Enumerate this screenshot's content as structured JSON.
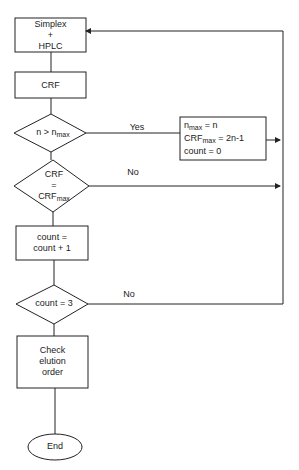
{
  "flowchart": {
    "nodes": {
      "start": {
        "type": "process",
        "line1": "Simplex",
        "line2": "+",
        "line3": "HPLC"
      },
      "crf": {
        "type": "process",
        "label": "CRF"
      },
      "decision1": {
        "type": "decision",
        "lhs": "n > n",
        "sub": "max"
      },
      "update": {
        "type": "process",
        "l1a": "n",
        "l1sub": "max",
        "l1b": " = n",
        "l2a": "CRF",
        "l2sub": "max",
        "l2b": " = 2n-1",
        "l3": "count = 0"
      },
      "decision2": {
        "type": "decision",
        "line1": "CRF",
        "line2": "=",
        "line3a": "CRF",
        "line3sub": "max"
      },
      "increment": {
        "type": "process",
        "line1": "count =",
        "line2": "count + 1"
      },
      "decision3": {
        "type": "decision",
        "label": "count = 3"
      },
      "check": {
        "type": "process",
        "line1": "Check",
        "line2": "elution",
        "line3": "order"
      },
      "end": {
        "type": "terminal",
        "label": "End"
      }
    },
    "edges": {
      "yes1": "Yes",
      "no2": "No",
      "no3": "No"
    }
  }
}
